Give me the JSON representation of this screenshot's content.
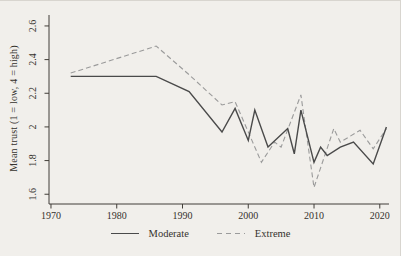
{
  "figure": {
    "background_color": "#f1efeb",
    "text_color": "#35322d",
    "axis_color": "#403d38"
  },
  "chart_data": {
    "type": "line",
    "title": "",
    "xlabel": "",
    "ylabel": "Mean trust (1 = low, 4 = high)",
    "grid": false,
    "legend_position": "bottom-center",
    "xlim": [
      1969.7,
      2021.4
    ],
    "ylim": [
      1.542,
      2.665
    ],
    "x_ticks": [
      {
        "value": 1970,
        "label": "1970"
      },
      {
        "value": 1980,
        "label": "1980"
      },
      {
        "value": 1990,
        "label": "1990"
      },
      {
        "value": 2000,
        "label": "2000"
      },
      {
        "value": 2010,
        "label": "2010"
      },
      {
        "value": 2020,
        "label": "2020"
      }
    ],
    "y_ticks": [
      {
        "value": 1.6,
        "label": "1.6"
      },
      {
        "value": 1.8,
        "label": "1.8"
      },
      {
        "value": 2.0,
        "label": "2"
      },
      {
        "value": 2.2,
        "label": "2.2"
      },
      {
        "value": 2.4,
        "label": "2.4"
      },
      {
        "value": 2.6,
        "label": "2.6"
      }
    ],
    "series": [
      {
        "name": "Extreme",
        "style": "dashed",
        "color": "#9b9b9b",
        "points": [
          [
            1973,
            2.32
          ],
          [
            1986,
            2.48
          ],
          [
            1991,
            2.31
          ],
          [
            1996,
            2.13
          ],
          [
            1998,
            2.15
          ],
          [
            2000,
            1.97
          ],
          [
            2002,
            1.79
          ],
          [
            2004,
            1.91
          ],
          [
            2005,
            1.88
          ],
          [
            2008,
            2.19
          ],
          [
            2010,
            1.64
          ],
          [
            2013,
            1.99
          ],
          [
            2014,
            1.91
          ],
          [
            2017,
            1.98
          ],
          [
            2019,
            1.87
          ],
          [
            2021,
            1.99
          ]
        ]
      },
      {
        "name": "Moderate",
        "style": "solid",
        "color": "#4a4a4a",
        "points": [
          [
            1973,
            2.3
          ],
          [
            1986,
            2.3
          ],
          [
            1991,
            2.21
          ],
          [
            1996,
            1.97
          ],
          [
            1998,
            2.11
          ],
          [
            2000,
            1.92
          ],
          [
            2001,
            2.1
          ],
          [
            2003,
            1.88
          ],
          [
            2006,
            1.99
          ],
          [
            2007,
            1.84
          ],
          [
            2008,
            2.1
          ],
          [
            2010,
            1.79
          ],
          [
            2011,
            1.88
          ],
          [
            2012,
            1.83
          ],
          [
            2014,
            1.88
          ],
          [
            2016,
            1.91
          ],
          [
            2019,
            1.78
          ],
          [
            2021,
            2.0
          ]
        ]
      }
    ],
    "legend_order": [
      "Moderate",
      "Extreme"
    ]
  }
}
